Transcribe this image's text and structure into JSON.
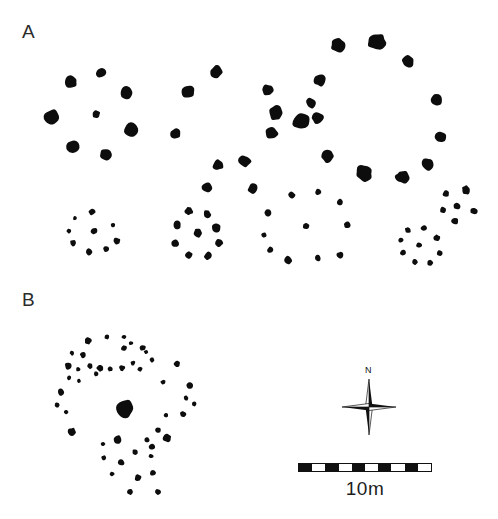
{
  "figure": {
    "type": "archaeological-site-plan",
    "background_color": "#ffffff",
    "stone_color": "#0d0d0d",
    "width": 498,
    "height": 519,
    "corner_artifact_text": ""
  },
  "panels": [
    {
      "id": "A",
      "label": "A",
      "x": 22,
      "y": 22,
      "description": "Large stone rings and small stone circles"
    },
    {
      "id": "B",
      "label": "B",
      "x": 22,
      "y": 290,
      "description": "Dense stone scatter with large central boulder"
    }
  ],
  "compass": {
    "name": "compass-rose",
    "north_label": "N",
    "x": 338,
    "y": 376,
    "size": 62,
    "points": 4
  },
  "scale": {
    "name": "scale-bar",
    "label": "10m",
    "value": 10,
    "unit": "m",
    "x": 298,
    "y": 463,
    "width": 134,
    "height": 9,
    "segments": 10,
    "colors": [
      "#111111",
      "#ffffff"
    ]
  },
  "chart_data": {
    "type": "scatter",
    "title": "",
    "xlabel": "",
    "ylabel": "",
    "xlim": [
      0,
      498
    ],
    "ylim": [
      0,
      519
    ],
    "grid": false,
    "legend": "none",
    "note": "Positions are image pixel coordinates; r is stone radius in px.",
    "groups": [
      {
        "name": "A-ring-left",
        "panel": "A",
        "kind": "stone-ring",
        "stones": [
          {
            "x": 52,
            "y": 117,
            "r": 8.5,
            "seed": 3
          },
          {
            "x": 71,
            "y": 82,
            "r": 6.5,
            "seed": 11
          },
          {
            "x": 101,
            "y": 73,
            "r": 5.0,
            "seed": 5
          },
          {
            "x": 96,
            "y": 114,
            "r": 4.2,
            "seed": 7
          },
          {
            "x": 127,
            "y": 93,
            "r": 6.8,
            "seed": 2
          },
          {
            "x": 131,
            "y": 130,
            "r": 7.4,
            "seed": 9
          },
          {
            "x": 73,
            "y": 147,
            "r": 7.0,
            "seed": 4
          },
          {
            "x": 106,
            "y": 154,
            "r": 6.6,
            "seed": 8
          },
          {
            "x": 176,
            "y": 134,
            "r": 5.4,
            "seed": 6
          }
        ]
      },
      {
        "name": "A-ring-middle",
        "panel": "A",
        "kind": "stone-ring",
        "stones": [
          {
            "x": 188,
            "y": 92,
            "r": 6.6,
            "seed": 12
          },
          {
            "x": 216,
            "y": 72,
            "r": 6.4,
            "seed": 1
          },
          {
            "x": 218,
            "y": 165,
            "r": 5.6,
            "seed": 13
          },
          {
            "x": 207,
            "y": 187,
            "r": 5.2,
            "seed": 14
          },
          {
            "x": 245,
            "y": 161,
            "r": 6.4,
            "seed": 15
          },
          {
            "x": 253,
            "y": 189,
            "r": 5.4,
            "seed": 16
          },
          {
            "x": 276,
            "y": 113,
            "r": 7.6,
            "seed": 17
          },
          {
            "x": 268,
            "y": 90,
            "r": 6.0,
            "seed": 18
          },
          {
            "x": 272,
            "y": 133,
            "r": 6.6,
            "seed": 19
          },
          {
            "x": 302,
            "y": 121,
            "r": 9.6,
            "seed": 20
          },
          {
            "x": 320,
            "y": 80,
            "r": 6.4,
            "seed": 21
          },
          {
            "x": 311,
            "y": 103,
            "r": 5.6,
            "seed": 22
          }
        ]
      },
      {
        "name": "A-ring-right",
        "panel": "A",
        "kind": "stone-ring",
        "stones": [
          {
            "x": 338,
            "y": 46,
            "r": 7.4,
            "seed": 23
          },
          {
            "x": 377,
            "y": 42,
            "r": 9.2,
            "seed": 24
          },
          {
            "x": 408,
            "y": 62,
            "r": 6.6,
            "seed": 25
          },
          {
            "x": 436,
            "y": 100,
            "r": 6.8,
            "seed": 26
          },
          {
            "x": 440,
            "y": 137,
            "r": 6.4,
            "seed": 27
          },
          {
            "x": 427,
            "y": 164,
            "r": 6.6,
            "seed": 28
          },
          {
            "x": 402,
            "y": 177,
            "r": 7.0,
            "seed": 29
          },
          {
            "x": 364,
            "y": 173,
            "r": 8.4,
            "seed": 30
          },
          {
            "x": 328,
            "y": 156,
            "r": 6.8,
            "seed": 31
          },
          {
            "x": 318,
            "y": 118,
            "r": 6.2,
            "seed": 32
          }
        ]
      },
      {
        "name": "A-circle-1",
        "panel": "A",
        "kind": "small-stone-circle",
        "stones": [
          {
            "x": 92,
            "y": 212,
            "r": 3.4,
            "seed": 33
          },
          {
            "x": 75,
            "y": 218,
            "r": 2.4,
            "seed": 34
          },
          {
            "x": 69,
            "y": 231,
            "r": 2.6,
            "seed": 35
          },
          {
            "x": 73,
            "y": 243,
            "r": 3.2,
            "seed": 36
          },
          {
            "x": 89,
            "y": 252,
            "r": 3.4,
            "seed": 37
          },
          {
            "x": 106,
            "y": 249,
            "r": 3.0,
            "seed": 38
          },
          {
            "x": 117,
            "y": 241,
            "r": 3.6,
            "seed": 39
          },
          {
            "x": 113,
            "y": 225,
            "r": 2.4,
            "seed": 40
          },
          {
            "x": 94,
            "y": 231,
            "r": 3.4,
            "seed": 41
          }
        ]
      },
      {
        "name": "A-circle-2",
        "panel": "A",
        "kind": "small-stone-circle",
        "stones": [
          {
            "x": 189,
            "y": 211,
            "r": 4.2,
            "seed": 42
          },
          {
            "x": 207,
            "y": 214,
            "r": 4.0,
            "seed": 43
          },
          {
            "x": 177,
            "y": 225,
            "r": 4.2,
            "seed": 44
          },
          {
            "x": 216,
            "y": 228,
            "r": 4.6,
            "seed": 45
          },
          {
            "x": 175,
            "y": 243,
            "r": 4.2,
            "seed": 46
          },
          {
            "x": 219,
            "y": 243,
            "r": 4.2,
            "seed": 47
          },
          {
            "x": 189,
            "y": 255,
            "r": 4.0,
            "seed": 48
          },
          {
            "x": 208,
            "y": 256,
            "r": 4.2,
            "seed": 49
          },
          {
            "x": 198,
            "y": 233,
            "r": 4.4,
            "seed": 50
          }
        ]
      },
      {
        "name": "A-circle-3",
        "panel": "A",
        "kind": "small-stone-circle",
        "stones": [
          {
            "x": 292,
            "y": 195,
            "r": 3.6,
            "seed": 51
          },
          {
            "x": 318,
            "y": 192,
            "r": 3.2,
            "seed": 52
          },
          {
            "x": 340,
            "y": 202,
            "r": 3.6,
            "seed": 53
          },
          {
            "x": 268,
            "y": 213,
            "r": 3.8,
            "seed": 54
          },
          {
            "x": 264,
            "y": 235,
            "r": 2.8,
            "seed": 55
          },
          {
            "x": 270,
            "y": 250,
            "r": 3.2,
            "seed": 56
          },
          {
            "x": 288,
            "y": 260,
            "r": 4.0,
            "seed": 57
          },
          {
            "x": 318,
            "y": 258,
            "r": 3.2,
            "seed": 58
          },
          {
            "x": 340,
            "y": 255,
            "r": 3.6,
            "seed": 59
          },
          {
            "x": 306,
            "y": 226,
            "r": 3.2,
            "seed": 60
          },
          {
            "x": 347,
            "y": 225,
            "r": 3.4,
            "seed": 61
          }
        ]
      },
      {
        "name": "A-circle-4",
        "panel": "A",
        "kind": "small-stone-circle",
        "stones": [
          {
            "x": 408,
            "y": 230,
            "r": 3.2,
            "seed": 62
          },
          {
            "x": 401,
            "y": 240,
            "r": 3.0,
            "seed": 63
          },
          {
            "x": 403,
            "y": 253,
            "r": 3.2,
            "seed": 64
          },
          {
            "x": 415,
            "y": 262,
            "r": 3.0,
            "seed": 65
          },
          {
            "x": 430,
            "y": 263,
            "r": 3.0,
            "seed": 66
          },
          {
            "x": 440,
            "y": 253,
            "r": 3.2,
            "seed": 67
          },
          {
            "x": 437,
            "y": 238,
            "r": 3.4,
            "seed": 68
          },
          {
            "x": 424,
            "y": 228,
            "r": 3.2,
            "seed": 69
          },
          {
            "x": 419,
            "y": 245,
            "r": 3.2,
            "seed": 70
          }
        ]
      },
      {
        "name": "A-cluster-upper-right",
        "panel": "A",
        "kind": "small-stone-cluster",
        "stones": [
          {
            "x": 446,
            "y": 194,
            "r": 3.6,
            "seed": 71
          },
          {
            "x": 466,
            "y": 190,
            "r": 4.6,
            "seed": 72
          },
          {
            "x": 443,
            "y": 210,
            "r": 3.2,
            "seed": 73
          },
          {
            "x": 457,
            "y": 206,
            "r": 3.6,
            "seed": 74
          },
          {
            "x": 474,
            "y": 211,
            "r": 3.6,
            "seed": 75
          },
          {
            "x": 455,
            "y": 221,
            "r": 3.8,
            "seed": 76
          }
        ]
      },
      {
        "name": "B-scatter-north-arc",
        "panel": "B",
        "kind": "stone-scatter",
        "stones": [
          {
            "x": 88,
            "y": 341,
            "r": 3.6,
            "seed": 80
          },
          {
            "x": 107,
            "y": 337,
            "r": 2.6,
            "seed": 81
          },
          {
            "x": 124,
            "y": 348,
            "r": 3.2,
            "seed": 82
          },
          {
            "x": 124,
            "y": 337,
            "r": 2.4,
            "seed": 83
          },
          {
            "x": 131,
            "y": 343,
            "r": 2.2,
            "seed": 84
          },
          {
            "x": 143,
            "y": 348,
            "r": 3.0,
            "seed": 85
          },
          {
            "x": 72,
            "y": 353,
            "r": 2.4,
            "seed": 86
          },
          {
            "x": 83,
            "y": 355,
            "r": 3.0,
            "seed": 87
          },
          {
            "x": 68,
            "y": 366,
            "r": 3.6,
            "seed": 88
          },
          {
            "x": 78,
            "y": 369,
            "r": 2.4,
            "seed": 89
          },
          {
            "x": 90,
            "y": 366,
            "r": 3.0,
            "seed": 90
          },
          {
            "x": 100,
            "y": 368,
            "r": 3.6,
            "seed": 91
          },
          {
            "x": 96,
            "y": 374,
            "r": 2.4,
            "seed": 92
          },
          {
            "x": 110,
            "y": 369,
            "r": 2.6,
            "seed": 93
          },
          {
            "x": 122,
            "y": 368,
            "r": 3.0,
            "seed": 94
          },
          {
            "x": 133,
            "y": 363,
            "r": 2.6,
            "seed": 95
          },
          {
            "x": 140,
            "y": 369,
            "r": 2.6,
            "seed": 96
          },
          {
            "x": 152,
            "y": 360,
            "r": 2.6,
            "seed": 97
          },
          {
            "x": 146,
            "y": 352,
            "r": 2.2,
            "seed": 98
          },
          {
            "x": 69,
            "y": 378,
            "r": 2.4,
            "seed": 99
          },
          {
            "x": 79,
            "y": 381,
            "r": 2.2,
            "seed": 100
          },
          {
            "x": 61,
            "y": 392,
            "r": 3.6,
            "seed": 101
          },
          {
            "x": 57,
            "y": 405,
            "r": 2.6,
            "seed": 102
          },
          {
            "x": 66,
            "y": 412,
            "r": 2.2,
            "seed": 103
          },
          {
            "x": 177,
            "y": 364,
            "r": 3.2,
            "seed": 104
          },
          {
            "x": 163,
            "y": 382,
            "r": 2.6,
            "seed": 105
          }
        ]
      },
      {
        "name": "B-central-boulder",
        "panel": "B",
        "kind": "large-central-stone",
        "stones": [
          {
            "x": 125,
            "y": 409,
            "r": 9.6,
            "seed": 110
          }
        ]
      },
      {
        "name": "B-scatter-south-arc",
        "panel": "B",
        "kind": "stone-scatter",
        "stones": [
          {
            "x": 72,
            "y": 432,
            "r": 4.4,
            "seed": 111
          },
          {
            "x": 103,
            "y": 444,
            "r": 2.4,
            "seed": 112
          },
          {
            "x": 118,
            "y": 440,
            "r": 4.6,
            "seed": 113
          },
          {
            "x": 190,
            "y": 386,
            "r": 3.6,
            "seed": 114
          },
          {
            "x": 186,
            "y": 398,
            "r": 2.6,
            "seed": 115
          },
          {
            "x": 194,
            "y": 404,
            "r": 2.4,
            "seed": 116
          },
          {
            "x": 183,
            "y": 414,
            "r": 3.2,
            "seed": 117
          },
          {
            "x": 166,
            "y": 415,
            "r": 2.6,
            "seed": 118
          },
          {
            "x": 158,
            "y": 430,
            "r": 3.2,
            "seed": 119
          },
          {
            "x": 147,
            "y": 440,
            "r": 2.8,
            "seed": 120
          },
          {
            "x": 152,
            "y": 447,
            "r": 3.0,
            "seed": 121
          },
          {
            "x": 151,
            "y": 456,
            "r": 2.4,
            "seed": 122
          },
          {
            "x": 167,
            "y": 438,
            "r": 4.2,
            "seed": 123
          },
          {
            "x": 135,
            "y": 452,
            "r": 3.0,
            "seed": 124
          },
          {
            "x": 121,
            "y": 462,
            "r": 3.6,
            "seed": 125
          },
          {
            "x": 112,
            "y": 474,
            "r": 2.6,
            "seed": 126
          },
          {
            "x": 104,
            "y": 458,
            "r": 2.6,
            "seed": 127
          },
          {
            "x": 138,
            "y": 478,
            "r": 3.6,
            "seed": 128
          },
          {
            "x": 153,
            "y": 473,
            "r": 3.2,
            "seed": 129
          },
          {
            "x": 130,
            "y": 492,
            "r": 3.0,
            "seed": 130
          },
          {
            "x": 158,
            "y": 492,
            "r": 3.0,
            "seed": 131
          }
        ]
      }
    ]
  }
}
